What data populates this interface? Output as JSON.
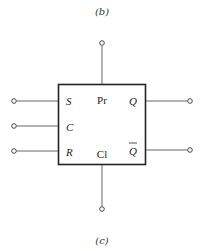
{
  "figure": {
    "top_caption": "(b)",
    "bottom_caption": "(c)"
  },
  "flipflop": {
    "pins": {
      "set": "S",
      "clock": "C",
      "reset": "R",
      "preset": "Pr",
      "clear": "Cl",
      "q": "Q",
      "q_bar": "Q"
    },
    "colors": {
      "line": "#222222",
      "wire": "#555555"
    }
  }
}
